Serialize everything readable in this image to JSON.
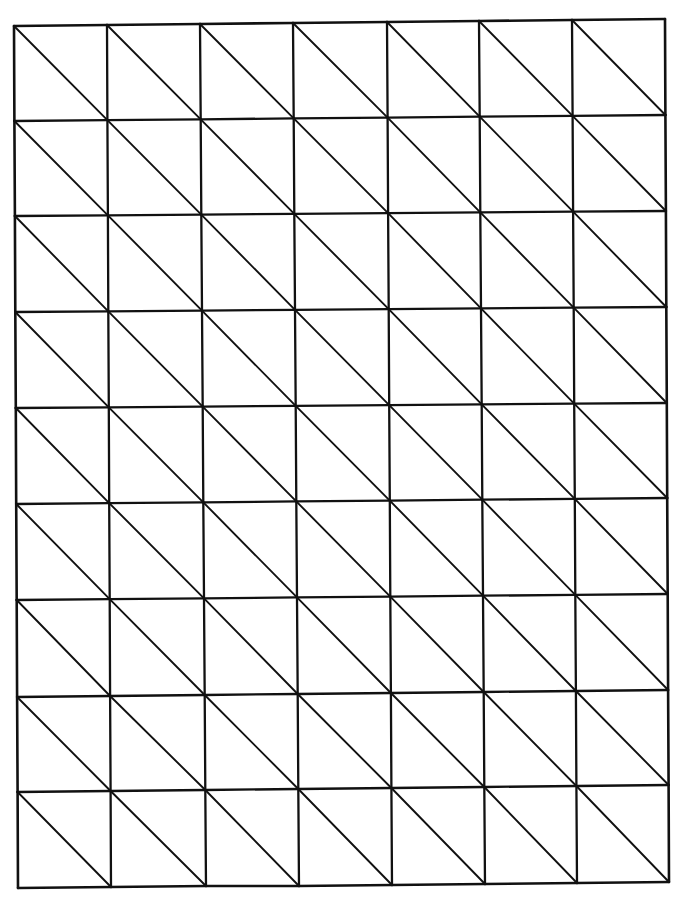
{
  "page": {
    "width": 687,
    "height": 905,
    "background": "#ffffff",
    "ink_color": "#111111"
  },
  "grid": {
    "columns": 7,
    "rows": 9,
    "diagonal_direction": "top-left-to-bottom-right",
    "top_edge_x": [
      14,
      107,
      200,
      293,
      387,
      479,
      572,
      665
    ],
    "top_edge_y": [
      26,
      25,
      24,
      23,
      22,
      21,
      20,
      19
    ],
    "bottom_edge_x": [
      18,
      111,
      206,
      299,
      392,
      485,
      577,
      669
    ],
    "bottom_edge_y": [
      888,
      887,
      886,
      886,
      885,
      884,
      883,
      882
    ],
    "left_edge_y": [
      26,
      121,
      216,
      312,
      408,
      504,
      600,
      697,
      792,
      888
    ],
    "right_edge_y": [
      19,
      115,
      211,
      307,
      403,
      498,
      594,
      690,
      785,
      882
    ]
  }
}
